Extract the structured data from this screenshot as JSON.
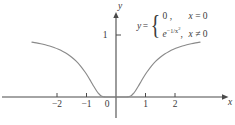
{
  "chart_data": {
    "type": "line",
    "title": "",
    "xlabel": "x",
    "ylabel": "y",
    "xlim": [
      -2.85,
      2.85
    ],
    "ylim": [
      -0.18,
      1.28
    ],
    "grid": false,
    "legend": null,
    "xticks": [
      -2,
      -1,
      0,
      1,
      2
    ],
    "xtick_labels": [
      "−2",
      "−1",
      "0",
      "1",
      "2"
    ],
    "yticks": [
      1
    ],
    "ytick_labels": [
      "1"
    ],
    "series": [
      {
        "name": "y = e^(-1/x^2)",
        "x": [
          -2.85,
          -2.7,
          -2.55,
          -2.4,
          -2.25,
          -2.1,
          -1.95,
          -1.8,
          -1.65,
          -1.5,
          -1.35,
          -1.2,
          -1.05,
          -0.95,
          -0.85,
          -0.75,
          -0.65,
          -0.6,
          -0.55,
          -0.5,
          -0.45,
          -0.4,
          -0.35,
          -0.3,
          -0.25,
          -0.2,
          -0.15,
          -0.1,
          0,
          0.1,
          0.15,
          0.2,
          0.25,
          0.3,
          0.35,
          0.4,
          0.45,
          0.5,
          0.55,
          0.6,
          0.65,
          0.75,
          0.85,
          0.95,
          1.05,
          1.2,
          1.35,
          1.5,
          1.65,
          1.8,
          1.95,
          2.1,
          2.25,
          2.4,
          2.55,
          2.7,
          2.85
        ],
        "y": [
          0.885,
          0.873,
          0.859,
          0.842,
          0.822,
          0.798,
          0.769,
          0.735,
          0.694,
          0.641,
          0.578,
          0.499,
          0.403,
          0.331,
          0.251,
          0.169,
          0.092,
          0.062,
          0.037,
          0.018,
          0.007,
          0.002,
          0.0003,
          2e-05,
          0.0,
          0.0,
          0.0,
          0.0,
          0.0,
          0.0,
          0.0,
          0.0,
          0.0,
          2e-05,
          0.0003,
          0.002,
          0.007,
          0.018,
          0.037,
          0.062,
          0.092,
          0.169,
          0.251,
          0.331,
          0.403,
          0.499,
          0.578,
          0.641,
          0.694,
          0.735,
          0.769,
          0.798,
          0.822,
          0.842,
          0.859,
          0.873,
          0.885
        ],
        "color": "#8a8a8a"
      }
    ],
    "annotation": {
      "lhs": "y",
      "equals": "=",
      "brace": "{",
      "cases": [
        {
          "value": "0 ,",
          "condition_var": "x",
          "condition_rest": " = 0"
        },
        {
          "value_base": "e",
          "value_exponent": "−1/x",
          "value_exponent_power": "2",
          "value_tail": ",",
          "condition_var": "x",
          "condition_rest": " ≠ 0"
        }
      ]
    },
    "colors": {
      "curve": "#8a8a8a",
      "axis": "#4a4a4a",
      "text": "#3a3a3a",
      "background": "#ffffff"
    }
  }
}
